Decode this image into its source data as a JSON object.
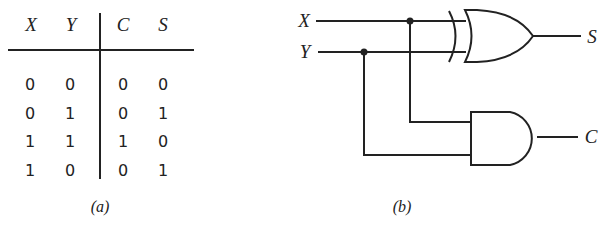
{
  "truth_table": {
    "headers": [
      "X",
      "Y",
      "C",
      "S"
    ],
    "rows": [
      [
        "0",
        "0",
        "0",
        "0"
      ],
      [
        "0",
        "1",
        "0",
        "1"
      ],
      [
        "1",
        "1",
        "1",
        "0"
      ],
      [
        "1",
        "0",
        "0",
        "1"
      ]
    ],
    "caption": "(a)"
  },
  "circuit": {
    "inputs": [
      "X",
      "Y"
    ],
    "outputs": [
      "S",
      "C"
    ],
    "gates": [
      {
        "type": "XOR",
        "inputs": [
          "X",
          "Y"
        ],
        "output": "S"
      },
      {
        "type": "AND",
        "inputs": [
          "X",
          "Y"
        ],
        "output": "C"
      }
    ],
    "caption": "(b)"
  }
}
